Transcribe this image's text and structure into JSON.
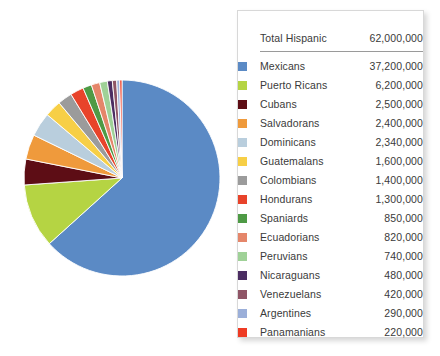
{
  "legend": {
    "total_label": "Total Hispanic",
    "total_value": "62,000,000",
    "rows": [
      {
        "label": "Mexicans",
        "value": "37,200,000",
        "color": "#5b8ac5",
        "number": 37200000
      },
      {
        "label": "Puerto Ricans",
        "value": "6,200,000",
        "color": "#b5d443",
        "number": 6200000
      },
      {
        "label": "Cubans",
        "value": "2,500,000",
        "color": "#5d0d15",
        "number": 2500000
      },
      {
        "label": "Salvadorans",
        "value": "2,400,000",
        "color": "#ef9a3c",
        "number": 2400000
      },
      {
        "label": "Dominicans",
        "value": "2,340,000",
        "color": "#b9cedd",
        "number": 2340000
      },
      {
        "label": "Guatemalans",
        "value": "1,600,000",
        "color": "#f7cf46",
        "number": 1600000
      },
      {
        "label": "Colombians",
        "value": "1,400,000",
        "color": "#9b9b9b",
        "number": 1400000
      },
      {
        "label": "Hondurans",
        "value": "1,300,000",
        "color": "#e8432a",
        "number": 1300000
      },
      {
        "label": "Spaniards",
        "value": "850,000",
        "color": "#4e9a45",
        "number": 850000
      },
      {
        "label": "Ecuadorians",
        "value": "820,000",
        "color": "#e5866a",
        "number": 820000
      },
      {
        "label": "Peruvians",
        "value": "740,000",
        "color": "#9fd197",
        "number": 740000
      },
      {
        "label": "Nicaraguans",
        "value": "480,000",
        "color": "#4b2d62",
        "number": 480000
      },
      {
        "label": "Venezuelans",
        "value": "420,000",
        "color": "#8f5566",
        "number": 420000
      },
      {
        "label": "Argentines",
        "value": "290,000",
        "color": "#9bafd9",
        "number": 290000
      },
      {
        "label": "Panamanians",
        "value": "220,000",
        "color": "#ee3b24",
        "number": 220000
      }
    ]
  },
  "chart_data": {
    "type": "pie",
    "title": "",
    "total": 62000000,
    "legend_position": "right",
    "start_angle_deg": 0,
    "direction": "clockwise",
    "categories": [
      "Mexicans",
      "Puerto Ricans",
      "Cubans",
      "Salvadorans",
      "Dominicans",
      "Guatemalans",
      "Colombians",
      "Hondurans",
      "Spaniards",
      "Ecuadorians",
      "Peruvians",
      "Nicaraguans",
      "Venezuelans",
      "Argentines",
      "Panamanians"
    ],
    "values": [
      37200000,
      6200000,
      2500000,
      2400000,
      2340000,
      1600000,
      1400000,
      1300000,
      850000,
      820000,
      740000,
      480000,
      420000,
      290000,
      220000
    ],
    "colors": [
      "#5b8ac5",
      "#b5d443",
      "#5d0d15",
      "#ef9a3c",
      "#b9cedd",
      "#f7cf46",
      "#9b9b9b",
      "#e8432a",
      "#4e9a45",
      "#e5866a",
      "#9fd197",
      "#4b2d62",
      "#8f5566",
      "#9bafd9",
      "#ee3b24"
    ]
  }
}
